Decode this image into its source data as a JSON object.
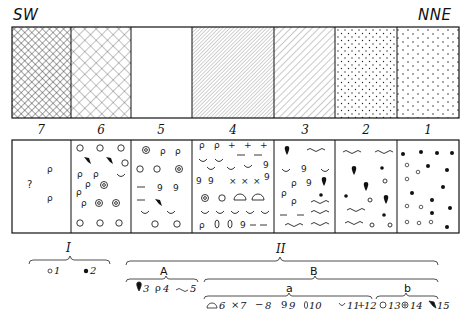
{
  "figure": {
    "direction_left": "SW",
    "direction_right": "NNE",
    "columns": [
      {
        "number": "7",
        "top_pattern": "dense-crosshatch",
        "symbols": [
          "?",
          "ρ",
          "ρ"
        ]
      },
      {
        "number": "6",
        "top_pattern": "open-crosshatch",
        "symbols": [
          "○",
          "◎",
          "ρ",
          "◡",
          "shell"
        ]
      },
      {
        "number": "5",
        "top_pattern": "blank",
        "symbols": [
          "◎",
          "○",
          "ρ",
          "9",
          "−",
          "◡",
          "shell"
        ]
      },
      {
        "number": "4",
        "top_pattern": "fine-diagonal",
        "symbols": [
          "ρ",
          "+",
          "−",
          "◡",
          "9",
          "×",
          "◎",
          "○",
          "dome",
          "0"
        ]
      },
      {
        "number": "3",
        "top_pattern": "coarse-diagonal",
        "symbols": [
          "drop",
          "~",
          "◡",
          "9",
          "ρ",
          "•",
          "−"
        ]
      },
      {
        "number": "2",
        "top_pattern": "dots",
        "symbols": [
          "~",
          "drop",
          "•",
          "○"
        ]
      },
      {
        "number": "1",
        "top_pattern": "dashes",
        "symbols": [
          "•",
          "○"
        ]
      }
    ]
  },
  "legend": {
    "group_I": {
      "label": "I",
      "items": [
        {
          "symbol": "○",
          "num": "1"
        },
        {
          "symbol": "●",
          "num": "2"
        }
      ]
    },
    "group_II": {
      "label": "II",
      "A": {
        "label": "A",
        "items": [
          {
            "symbol": "drop",
            "num": "3"
          },
          {
            "symbol": "ρ",
            "num": "4"
          },
          {
            "symbol": "~",
            "num": "5"
          }
        ]
      },
      "B": {
        "label": "B",
        "a": {
          "label": "a",
          "items": [
            {
              "symbol": "dome",
              "num": "6"
            },
            {
              "symbol": "×",
              "num": "7"
            },
            {
              "symbol": "−",
              "num": "8"
            },
            {
              "symbol": "9",
              "num": "9"
            },
            {
              "symbol": "0",
              "num": "10"
            },
            {
              "symbol": "◡",
              "num": "11"
            },
            {
              "symbol": "+",
              "num": "12"
            }
          ]
        },
        "b": {
          "label": "b",
          "items": [
            {
              "symbol": "○",
              "num": "13"
            },
            {
              "symbol": "◎",
              "num": "14"
            },
            {
              "symbol": "shell",
              "num": "15"
            }
          ]
        }
      }
    }
  }
}
